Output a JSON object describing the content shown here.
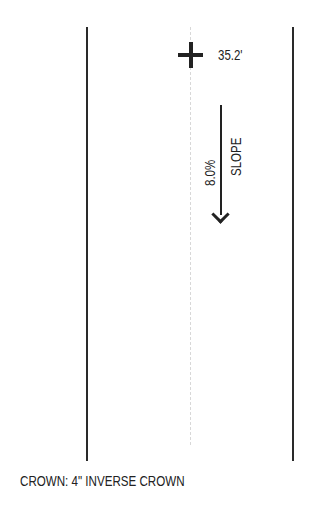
{
  "diagram": {
    "elevation_label": "35.2'",
    "slope_percent": "8.0%",
    "slope_label": "SLOPE",
    "slope_direction": "down",
    "crown_label": "CROWN: 4\" INVERSE CROWN"
  }
}
